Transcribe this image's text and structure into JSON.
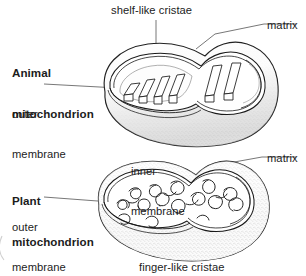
{
  "figure": {
    "background_color": "#ffffff",
    "line_color": "#1a1a1a",
    "shade_color": "#c9c9c9",
    "text_color": "#1c1c1c"
  },
  "labels": {
    "shelf_like_cristae": "shelf-like cristae",
    "matrix_animal": "matrix",
    "animal_title_line1": "Animal",
    "animal_title_line2": "mitochondrion",
    "outer_membrane_animal_line1": "outer",
    "outer_membrane_animal_line2": "membrane",
    "inner_membrane_line1": "inner",
    "inner_membrane_line2": "membrane",
    "matrix_plant": "matrix",
    "plant_title_line1": "Plant",
    "plant_title_line2": "mitochondrion",
    "outer_membrane_plant_line1": "outer",
    "outer_membrane_plant_line2": "membrane",
    "finger_like_cristae": "finger-like cristae"
  },
  "diagrams": [
    {
      "name": "animal-mitochondrion",
      "cristae_type": "shelf-like",
      "cristae_count": 6,
      "callouts": [
        "shelf-like cristae",
        "matrix",
        "outer membrane",
        "inner membrane"
      ]
    },
    {
      "name": "plant-mitochondrion",
      "cristae_type": "finger-like",
      "callouts": [
        "matrix",
        "outer membrane",
        "inner membrane",
        "finger-like cristae"
      ]
    }
  ]
}
